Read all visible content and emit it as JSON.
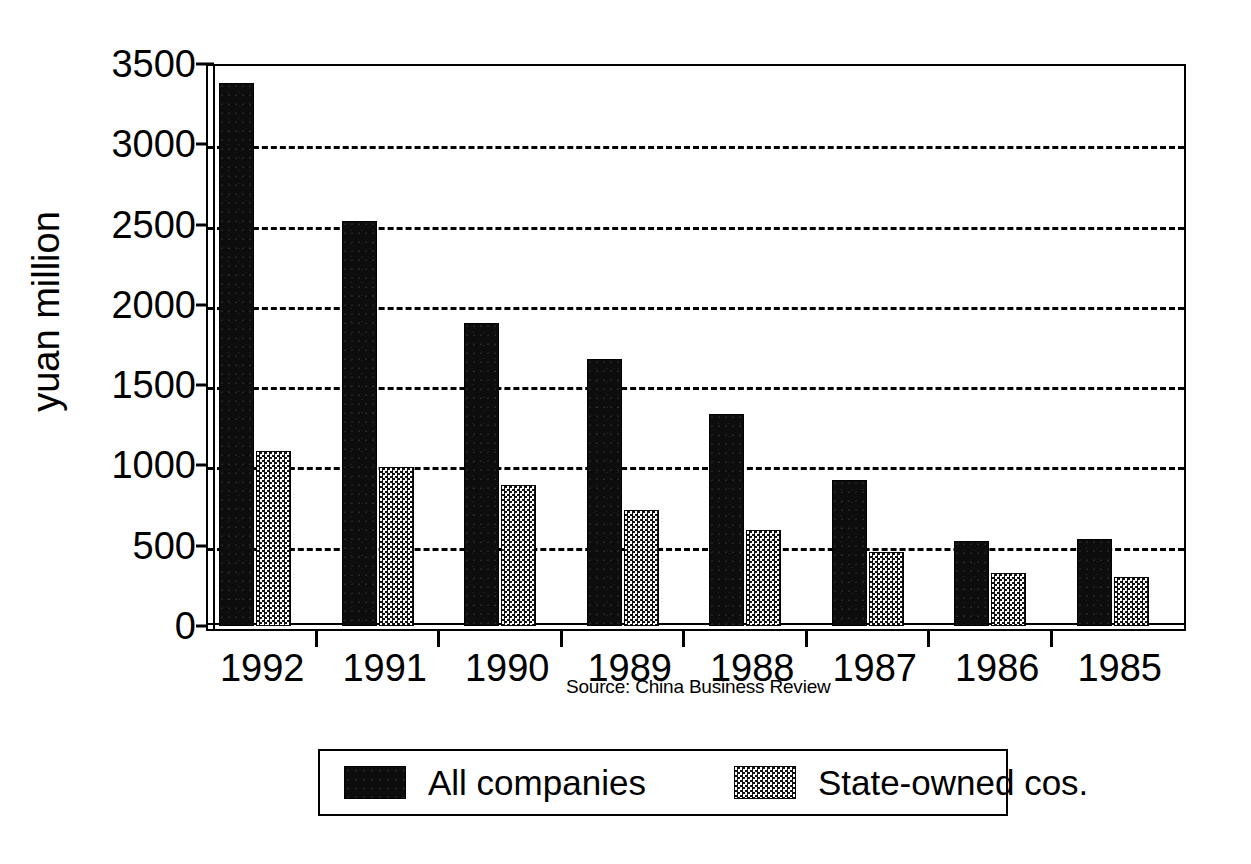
{
  "chart_data": {
    "type": "bar",
    "title": "",
    "xlabel": "",
    "ylabel": "yuan million",
    "ylim": [
      0,
      3500
    ],
    "yticks": [
      0,
      500,
      1000,
      1500,
      2000,
      2500,
      3000,
      3500
    ],
    "ytick_labels": [
      "0",
      "500",
      "1000",
      "1500",
      "2000",
      "2500",
      "3000",
      "3500"
    ],
    "grid": true,
    "grid_style": "dashed horizontal",
    "legend_position": "bottom",
    "categories": [
      "1992",
      "1991",
      "1990",
      "1989",
      "1988",
      "1987",
      "1986",
      "1985"
    ],
    "series": [
      {
        "name": "All companies",
        "values": [
          3380,
          2520,
          1890,
          1660,
          1320,
          910,
          530,
          540
        ],
        "color": "#0d0d0d",
        "pattern": "solid-black"
      },
      {
        "name": "State-owned cos.",
        "values": [
          1090,
          990,
          880,
          720,
          600,
          460,
          330,
          305
        ],
        "color": "#808080",
        "pattern": "checkered-halftone"
      }
    ],
    "annotations": [
      "Source: China Business Review"
    ]
  },
  "axes": {
    "y_title": "yuan million",
    "y_tick_labels": [
      "3500",
      "3000",
      "2500",
      "2000",
      "1500",
      "1000",
      "500",
      "0"
    ],
    "x_tick_labels": [
      "1992",
      "1991",
      "1990",
      "1989",
      "1988",
      "1987",
      "1986",
      "1985"
    ]
  },
  "source": {
    "text": "Source: China Business Review"
  },
  "legend": {
    "entries": [
      {
        "label": "All companies",
        "swatch": "solid-black-swatch"
      },
      {
        "label": "State-owned cos.",
        "swatch": "checkered-swatch"
      }
    ]
  }
}
